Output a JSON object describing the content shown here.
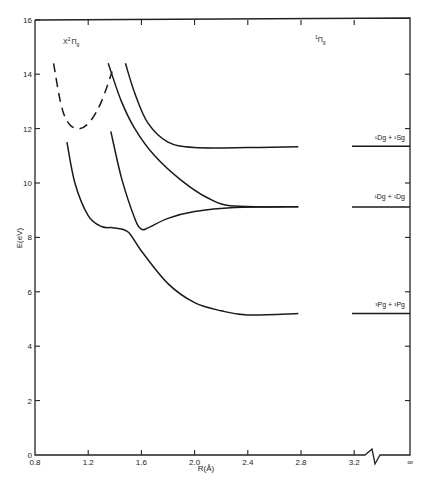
{
  "chart_data": {
    "type": "line",
    "title": "",
    "xlabel": "R(Å)",
    "ylabel": "E(eV)",
    "xlim": [
      0.8,
      "∞"
    ],
    "ylim": [
      0,
      16
    ],
    "x_ticks": [
      "0.8",
      "1.2",
      "1.6",
      "2.0",
      "2.4",
      "2.8",
      "3.2",
      "∞"
    ],
    "y_ticks": [
      "0",
      "2",
      "4",
      "6",
      "8",
      "10",
      "12",
      "14",
      "16"
    ],
    "grid": false,
    "axis_break": "between 3.2 and ∞",
    "annotations": [
      {
        "text": "X²Πg",
        "R": 1.0,
        "E": 14.3
      },
      {
        "text": "¹Πg",
        "R": 3.2,
        "E": 14.8
      }
    ],
    "series": [
      {
        "name": "X²Πg (ion, dashed)",
        "style": "dashed",
        "points": [
          [
            0.94,
            14.4
          ],
          [
            1.0,
            12.8
          ],
          [
            1.06,
            12.15
          ],
          [
            1.14,
            12.0
          ],
          [
            1.22,
            12.3
          ],
          [
            1.3,
            13.0
          ],
          [
            1.38,
            14.1
          ]
        ]
      },
      {
        "name": "¹Πg upper (→ ¹Dg + ¹Sg)",
        "style": "solid",
        "asymptote_label": "¹Dg + ¹Sg",
        "asymptote_E": 11.35,
        "points": [
          [
            1.48,
            14.4
          ],
          [
            1.55,
            13.3
          ],
          [
            1.65,
            12.2
          ],
          [
            1.8,
            11.5
          ],
          [
            2.0,
            11.3
          ],
          [
            2.4,
            11.3
          ],
          [
            2.78,
            11.33
          ]
        ]
      },
      {
        "name": "¹Πg middle-upper (→ ¹Dg + ¹Dg)",
        "style": "solid",
        "points": [
          [
            1.35,
            14.4
          ],
          [
            1.45,
            13.0
          ],
          [
            1.55,
            12.0
          ],
          [
            1.7,
            11.0
          ],
          [
            1.9,
            10.1
          ],
          [
            2.1,
            9.45
          ],
          [
            2.3,
            9.15
          ],
          [
            2.78,
            9.13
          ]
        ]
      },
      {
        "name": "¹Πg middle-lower (→ ¹Dg + ¹Dg)",
        "style": "solid",
        "asymptote_label": "¹Dg + ¹Dg",
        "asymptote_E": 9.12,
        "points": [
          [
            1.37,
            11.9
          ],
          [
            1.45,
            10.2
          ],
          [
            1.55,
            8.7
          ],
          [
            1.6,
            8.3
          ],
          [
            1.65,
            8.35
          ],
          [
            1.8,
            8.7
          ],
          [
            2.0,
            8.95
          ],
          [
            2.3,
            9.1
          ],
          [
            2.78,
            9.13
          ]
        ]
      },
      {
        "name": "¹Πg lower (→ ³Pg + ³Pg)",
        "style": "solid",
        "asymptote_label": "³Pg + ³Pg",
        "asymptote_E": 5.2,
        "points": [
          [
            1.04,
            11.5
          ],
          [
            1.1,
            10.0
          ],
          [
            1.2,
            8.8
          ],
          [
            1.3,
            8.4
          ],
          [
            1.4,
            8.35
          ],
          [
            1.5,
            8.2
          ],
          [
            1.6,
            7.5
          ],
          [
            1.8,
            6.3
          ],
          [
            2.0,
            5.6
          ],
          [
            2.2,
            5.3
          ],
          [
            2.4,
            5.15
          ],
          [
            2.78,
            5.2
          ]
        ]
      }
    ]
  },
  "labels": {
    "xlabel": "R(Å)",
    "ylabel": "E(eV)",
    "state_ion": "X",
    "state_ion_sup": "2",
    "state_ion_main": "Π",
    "state_ion_sub": "g",
    "symmetry_sup": "1",
    "symmetry_main": "Π",
    "symmetry_sub": "g",
    "asym_top": "¹Dg + ¹Sg",
    "asym_mid": "¹Dg + ¹Dg",
    "asym_low": "³Pg + ³Pg"
  }
}
